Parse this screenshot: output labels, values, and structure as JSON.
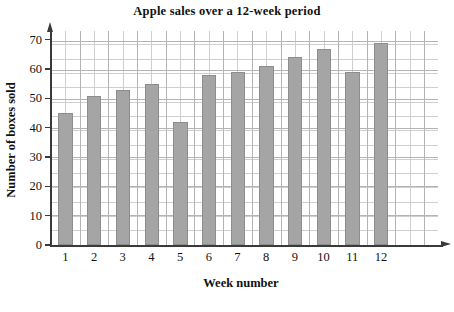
{
  "chart_data": {
    "type": "bar",
    "title": "Apple sales over a 12-week period",
    "xlabel": "Week number",
    "ylabel": "Number of boxes sold",
    "categories": [
      "1",
      "2",
      "3",
      "4",
      "5",
      "6",
      "7",
      "8",
      "9",
      "10",
      "11",
      "12"
    ],
    "values": [
      45,
      51,
      53,
      55,
      42,
      58,
      59,
      61,
      64,
      67,
      59,
      69
    ],
    "ylim": [
      0,
      73
    ],
    "ytick_labels": [
      "0",
      "10",
      "20",
      "30",
      "40",
      "50",
      "60",
      "70"
    ],
    "ytick_values": [
      0,
      10,
      20,
      30,
      40,
      50,
      60,
      70
    ],
    "y_major_step": 10,
    "y_minor_step": 5,
    "grid": true,
    "legend": "none",
    "bar_color": "#a5a5a5",
    "bar_edge_color": "#8d8d8d",
    "grid_color": "#cfcfcf",
    "grid_major_color": "#b4b4b4",
    "axis_color": "#3a3a3a",
    "background": "#ffffff"
  }
}
